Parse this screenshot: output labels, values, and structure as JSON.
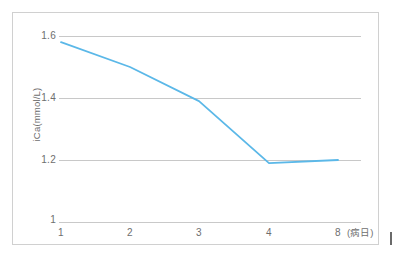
{
  "chart_data": {
    "type": "line",
    "title": "",
    "xlabel": "(病日)",
    "ylabel": "iCa(mmol/L)",
    "x": [
      1,
      2,
      3,
      4,
      8
    ],
    "categories": [
      "1",
      "2",
      "3",
      "4",
      "8"
    ],
    "values": [
      1.58,
      1.5,
      1.39,
      1.19,
      1.2
    ],
    "series": [
      {
        "name": "iCa",
        "values": [
          1.58,
          1.5,
          1.39,
          1.19,
          1.2
        ],
        "color": "#5bb8e8"
      }
    ],
    "ylim": [
      1.0,
      1.65
    ],
    "yticks": [
      1.0,
      1.2,
      1.4,
      1.6
    ],
    "ytick_labels": [
      "1",
      "1.2",
      "1.4",
      "1.6"
    ],
    "xtick_labels": [
      "1",
      "2",
      "3",
      "4",
      "8"
    ],
    "grid": true,
    "grid_axis": "y",
    "legend": false,
    "legend_position": "none"
  },
  "axis": {
    "y_title": "iCa(mmol/L)",
    "x_annotation": "(病日)",
    "y_ticks": [
      {
        "label": "1.6"
      },
      {
        "label": "1.4"
      },
      {
        "label": "1.2"
      },
      {
        "label": "1"
      }
    ],
    "x_ticks": [
      {
        "label": "1"
      },
      {
        "label": "2"
      },
      {
        "label": "3"
      },
      {
        "label": "4"
      },
      {
        "label": "8"
      }
    ]
  },
  "colors": {
    "line": "#5bb8e8",
    "grid": "#c8c8c8",
    "frame": "#d0d0d0",
    "text": "#6e6e6e",
    "background": "#ffffff"
  }
}
